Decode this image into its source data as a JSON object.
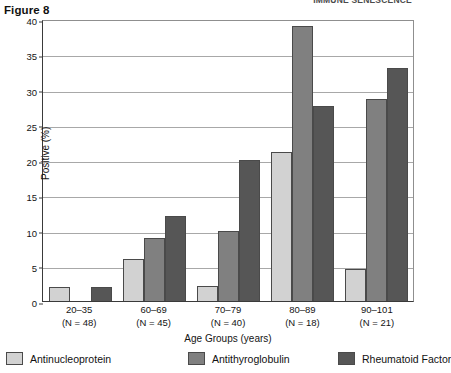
{
  "running_head": "IMMUNE SENESCENCE",
  "figure_label": "Figure 8",
  "chart_data": {
    "type": "bar",
    "title": "Figure 8",
    "xlabel": "Age Groups (years)",
    "ylabel": "Positive (%)",
    "ylim": [
      0,
      40
    ],
    "yticks": [
      0,
      5,
      10,
      15,
      20,
      25,
      30,
      35,
      40
    ],
    "grid": true,
    "legend_position": "bottom",
    "categories": [
      "20–35",
      "60–69",
      "70–79",
      "80–89",
      "90–101"
    ],
    "category_sublabels": [
      "(N = 48)",
      "(N = 45)",
      "(N = 40)",
      "(N = 18)",
      "(N = 21)"
    ],
    "group_sizes": [
      48,
      45,
      40,
      18,
      21
    ],
    "series": [
      {
        "name": "Antinucleoprotein",
        "color": "#d2d2d2",
        "values": [
          2.0,
          6.0,
          2.2,
          21.2,
          4.5
        ]
      },
      {
        "name": "Antithyroglobulin",
        "color": "#808080",
        "values": [
          0,
          9.0,
          10.0,
          39.0,
          28.6
        ]
      },
      {
        "name": "Rheumatoid Factor",
        "color": "#565656",
        "values": [
          2.0,
          12.0,
          20.0,
          27.6,
          33.1
        ]
      }
    ]
  }
}
